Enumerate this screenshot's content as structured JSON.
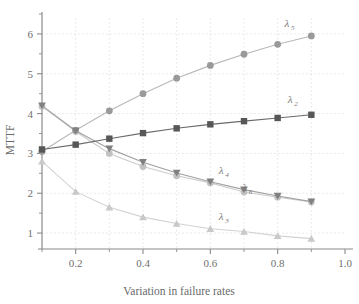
{
  "chart_data": {
    "type": "line",
    "title": "",
    "xlabel": "Variation in failure rates",
    "ylabel": "MTTF",
    "xlim": [
      0.1,
      1.0
    ],
    "ylim": [
      0.6,
      6.4
    ],
    "grid": true,
    "legend_position": "inline-annotations",
    "x": [
      0.1,
      0.2,
      0.3,
      0.4,
      0.5,
      0.6,
      0.7,
      0.8,
      0.9
    ],
    "xticks": [
      0.2,
      0.4,
      0.6,
      0.8,
      1.0
    ],
    "xtick_labels": [
      "0.2",
      "0.4",
      "0.6",
      "0.8",
      "1.0"
    ],
    "xminor_ticks": [
      0.1,
      0.3,
      0.5,
      0.7,
      0.9
    ],
    "yticks": [
      1,
      2,
      3,
      4,
      5,
      6
    ],
    "ytick_labels": [
      "1",
      "2",
      "3",
      "4",
      "5",
      "6"
    ],
    "yminor_ticks": [
      1.5,
      2.5,
      3.5,
      4.5,
      5.5,
      6.5
    ],
    "series": [
      {
        "name": "lambda-5",
        "label": "λ",
        "subscript": "5",
        "marker": "circle",
        "color": "#9a9a9a",
        "line_color": "#b8b8b8",
        "values": [
          3.05,
          3.58,
          4.07,
          4.5,
          4.89,
          5.21,
          5.49,
          5.74,
          5.95
        ],
        "label_x": 0.82,
        "label_y": 6.18
      },
      {
        "name": "lambda-2",
        "label": "λ",
        "subscript": "2",
        "marker": "square",
        "color": "#575757",
        "line_color": "#6a6a6a",
        "values": [
          3.1,
          3.22,
          3.37,
          3.51,
          3.63,
          3.73,
          3.81,
          3.89,
          3.97
        ],
        "label_x": 0.83,
        "label_y": 4.26
      },
      {
        "name": "lambda-4",
        "label": "λ",
        "subscript": "4",
        "marker": "triangle-down",
        "color": "#808080",
        "line_color": "#a0a0a0",
        "values": [
          4.2,
          3.57,
          3.12,
          2.78,
          2.51,
          2.29,
          2.09,
          1.93,
          1.79
        ],
        "label_x": 0.625,
        "label_y": 2.49
      },
      {
        "name": "lambda-6",
        "label": "λ",
        "subscript": "6",
        "marker": "circle-light",
        "color": "#c2c2c2",
        "line_color": "#cccccc",
        "values": [
          4.18,
          3.55,
          3.0,
          2.67,
          2.44,
          2.26,
          2.03,
          1.9,
          1.78
        ],
        "label_x": 0.695,
        "label_y": 2.05
      },
      {
        "name": "lambda-3",
        "label": "λ",
        "subscript": "3",
        "marker": "triangle-up",
        "color": "#c9c9c9",
        "line_color": "#d2d2d2",
        "values": [
          2.8,
          2.04,
          1.65,
          1.4,
          1.24,
          1.11,
          1.04,
          0.93,
          0.86
        ],
        "label_x": 0.625,
        "label_y": 1.33
      }
    ]
  },
  "axes": {
    "x_title": "Variation in failure rates",
    "y_title": "MTTF"
  },
  "colors": {
    "grid": "#e2dcdc",
    "axis": "#8a8a8a",
    "text": "#6f6f6f",
    "background": "#ffffff"
  }
}
